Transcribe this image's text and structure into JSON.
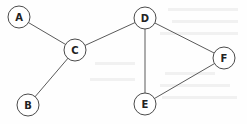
{
  "diagram": {
    "type": "undirected-graph",
    "node_radius": 11,
    "nodes": [
      {
        "id": "A",
        "label": "A",
        "x": 19,
        "y": 17
      },
      {
        "id": "B",
        "label": "B",
        "x": 28,
        "y": 105
      },
      {
        "id": "C",
        "label": "C",
        "x": 75,
        "y": 50
      },
      {
        "id": "D",
        "label": "D",
        "x": 145,
        "y": 18
      },
      {
        "id": "E",
        "label": "E",
        "x": 145,
        "y": 104
      },
      {
        "id": "F",
        "label": "F",
        "x": 224,
        "y": 58
      }
    ],
    "edges": [
      {
        "from": "A",
        "to": "C"
      },
      {
        "from": "B",
        "to": "C"
      },
      {
        "from": "C",
        "to": "D"
      },
      {
        "from": "D",
        "to": "E"
      },
      {
        "from": "D",
        "to": "F"
      },
      {
        "from": "E",
        "to": "F"
      }
    ],
    "colors": {
      "edge": "#5a5a5a",
      "node_stroke": "#4a4a4a",
      "node_fill": "#ffffff",
      "label": "#222222"
    }
  }
}
